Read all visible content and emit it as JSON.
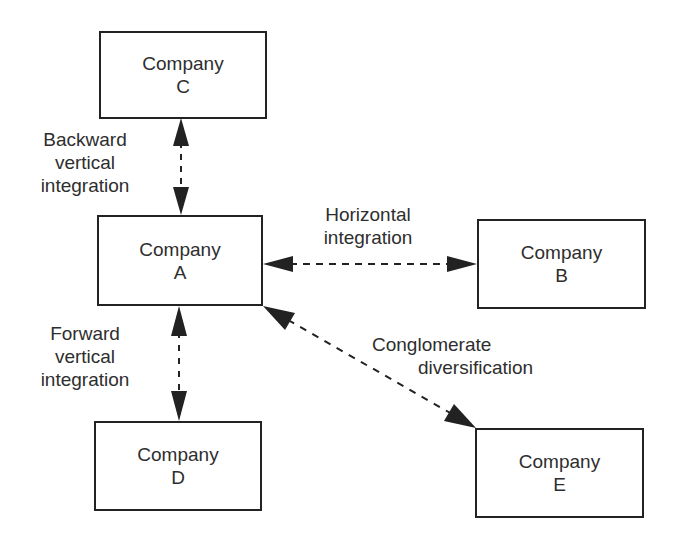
{
  "diagram": {
    "colors": {
      "line": "#222222",
      "text": "#2e2e2e",
      "background": "#ffffff"
    },
    "nodes": {
      "c": {
        "line1": "Company",
        "line2": "C"
      },
      "a": {
        "line1": "Company",
        "line2": "A"
      },
      "b": {
        "line1": "Company",
        "line2": "B"
      },
      "d": {
        "line1": "Company",
        "line2": "D"
      },
      "e": {
        "line1": "Company",
        "line2": "E"
      }
    },
    "edges": {
      "backward": {
        "line1": "Backward",
        "line2": "vertical",
        "line3": "integration",
        "from": "A",
        "to": "C"
      },
      "horizontal": {
        "line1": "Horizontal",
        "line2": "integration",
        "from": "A",
        "to": "B"
      },
      "forward": {
        "line1": "Forward",
        "line2": "vertical",
        "line3": "integration",
        "from": "A",
        "to": "D"
      },
      "conglomerate": {
        "line1": "Conglomerate",
        "line2": "diversification",
        "from": "A",
        "to": "E"
      }
    }
  }
}
